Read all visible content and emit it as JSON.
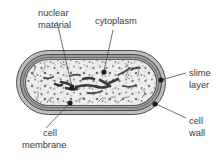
{
  "diagram": {
    "background_color": "#ffffff",
    "labels": [
      {
        "id": "nuclear-material",
        "line1": "nuclear",
        "line2": "material",
        "text_x": 38,
        "text_y": 16,
        "anchor": "start",
        "point_x": 72,
        "point_y": 88
      },
      {
        "id": "cytoplasm",
        "line1": "cytoplasm",
        "line2": "",
        "text_x": 95,
        "text_y": 24,
        "anchor": "start",
        "point_x": 104,
        "point_y": 72
      },
      {
        "id": "slime-layer",
        "line1": "slime",
        "line2": "layer",
        "text_x": 189,
        "text_y": 76,
        "anchor": "start",
        "point_x": 161,
        "point_y": 80
      },
      {
        "id": "cell-wall",
        "line1": "cell",
        "line2": "wall",
        "text_x": 189,
        "text_y": 124,
        "anchor": "start",
        "point_x": 155,
        "point_y": 103
      },
      {
        "id": "cell-membrane",
        "line1": "cell",
        "line2": "membrane",
        "text_x": 43,
        "text_y": 136,
        "anchor": "start",
        "point_x": 70,
        "point_y": 103
      }
    ],
    "structures": [
      {
        "name": "slime layer",
        "color": "#b9b9b9",
        "role": "outermost capsule layer"
      },
      {
        "name": "cell wall",
        "color": "#8e8e8e",
        "role": "rigid wall beneath slime layer"
      },
      {
        "name": "cell membrane",
        "color": "#6e6e6e",
        "role": "thin inner boundary line"
      },
      {
        "name": "cytoplasm",
        "color": "#ededed",
        "role": "stippled granular interior"
      },
      {
        "name": "nuclear material",
        "color": "#3b3b3b",
        "role": "dark irregular strands at centre"
      }
    ],
    "geometry": {
      "cell_left": 16,
      "cell_top": 50,
      "cell_width": 150,
      "cell_height": 65,
      "corner_radius": 32
    }
  }
}
